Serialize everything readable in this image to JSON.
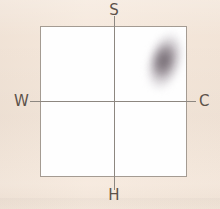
{
  "figure": {
    "type": "scatter-density",
    "background_color": "#f5e7da",
    "plot_background_color": "#fefefe",
    "frame_color": "#a49b92",
    "axis_color": "#8d8780",
    "label_color": "#5c5149",
    "blob_color": "#9a9098"
  },
  "axes": {
    "top_label": "S",
    "bottom_label": "H",
    "left_label": "W",
    "right_label": "C"
  },
  "chart_data": {
    "type": "scatter",
    "title": "",
    "subtitle": "",
    "xlabel": "",
    "ylabel": "",
    "xlim": [
      -1,
      1
    ],
    "ylim": [
      -1,
      1
    ],
    "grid": false,
    "legend": "none",
    "axis_endpoint_labels": {
      "north": "S",
      "south": "H",
      "west": "W",
      "east": "C"
    },
    "annotations": [],
    "tick_labels": {
      "x": [],
      "y": []
    },
    "series": [
      {
        "name": "density-cluster",
        "kind": "kernel-density-blob",
        "quadrant": "upper-right",
        "center": [
          0.67,
          0.52
        ],
        "extent_x": [
          0.41,
          0.98
        ],
        "extent_y": [
          0.08,
          0.98
        ],
        "orientation_degrees": 17,
        "peak_opacity": 0.92,
        "color": "#9a9098"
      }
    ]
  }
}
